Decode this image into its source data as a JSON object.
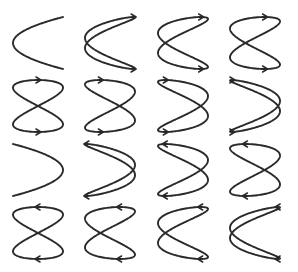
{
  "colors": {
    "background": "#ffffff",
    "stroke": "#2a2a2a"
  },
  "grid": {
    "rows": 4,
    "cols": 4,
    "col_centers": [
      38,
      110,
      183,
      255
    ],
    "row_centers": [
      43,
      106,
      170,
      233
    ],
    "half_width": 25,
    "half_height": 26
  },
  "figures": [
    {
      "row": 0,
      "col": 0,
      "phase_deg": 0,
      "arrows": false,
      "direction": "right"
    },
    {
      "row": 0,
      "col": 1,
      "phase_deg": 22.5,
      "arrows": true,
      "direction": "right"
    },
    {
      "row": 0,
      "col": 2,
      "phase_deg": 45,
      "arrows": true,
      "direction": "right"
    },
    {
      "row": 0,
      "col": 3,
      "phase_deg": 67.5,
      "arrows": true,
      "direction": "right"
    },
    {
      "row": 1,
      "col": 0,
      "phase_deg": 90,
      "arrows": true,
      "direction": "right"
    },
    {
      "row": 1,
      "col": 1,
      "phase_deg": 112.5,
      "arrows": true,
      "direction": "right"
    },
    {
      "row": 1,
      "col": 2,
      "phase_deg": 135,
      "arrows": true,
      "direction": "right"
    },
    {
      "row": 1,
      "col": 3,
      "phase_deg": 157.5,
      "arrows": true,
      "direction": "right"
    },
    {
      "row": 2,
      "col": 0,
      "phase_deg": 180,
      "arrows": false,
      "direction": "left"
    },
    {
      "row": 2,
      "col": 1,
      "phase_deg": 202.5,
      "arrows": true,
      "direction": "left"
    },
    {
      "row": 2,
      "col": 2,
      "phase_deg": 225,
      "arrows": true,
      "direction": "left"
    },
    {
      "row": 2,
      "col": 3,
      "phase_deg": 247.5,
      "arrows": true,
      "direction": "left"
    },
    {
      "row": 3,
      "col": 0,
      "phase_deg": 270,
      "arrows": true,
      "direction": "left"
    },
    {
      "row": 3,
      "col": 1,
      "phase_deg": 292.5,
      "arrows": true,
      "direction": "left"
    },
    {
      "row": 3,
      "col": 2,
      "phase_deg": 315,
      "arrows": true,
      "direction": "left"
    },
    {
      "row": 3,
      "col": 3,
      "phase_deg": 337.5,
      "arrows": true,
      "direction": "left"
    }
  ]
}
